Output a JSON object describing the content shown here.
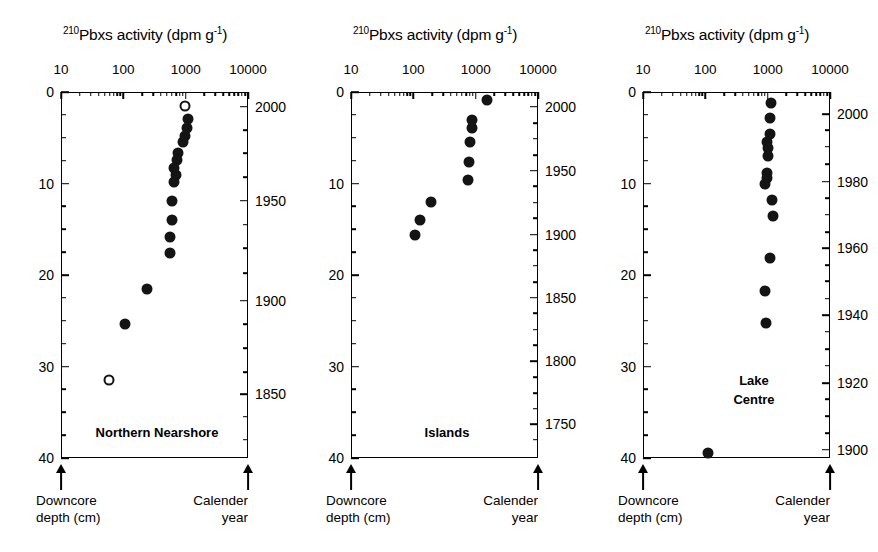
{
  "figure": {
    "background": "#ffffff",
    "marker_color": "#141414",
    "width": 878,
    "height": 552
  },
  "axis_title": {
    "superscript": "210",
    "main": "Pbxs activity (dpm g",
    "exponent": "-1",
    "close": ")",
    "full": "210Pbxs activity (dpm g-1)"
  },
  "footer": {
    "left_line1": "Downcore",
    "left_line2": "depth (cm)",
    "right_line1": "Calender",
    "right_line2": "year"
  },
  "chart_data": [
    {
      "type": "scatter",
      "title": "210Pbxs activity (dpm g-1)",
      "panel_label": "Northern Nearshore",
      "panel_label_lines": [
        "Northern Nearshore"
      ],
      "xlabel": "210Pbxs activity (dpm g-1)",
      "ylabel": "Downcore depth (cm)",
      "y2label": "Calender year",
      "xscale": "log",
      "xlim": [
        10,
        10000
      ],
      "xticks": [
        10,
        100,
        1000,
        10000
      ],
      "xtick_labels": [
        "10",
        "100",
        "1000",
        "10000"
      ],
      "ylim": [
        0,
        40
      ],
      "yticks": [
        0,
        10,
        20,
        30,
        40
      ],
      "ytick_labels": [
        "0",
        "10",
        "20",
        "30",
        "40"
      ],
      "y_minor_step": 2.5,
      "year_axis": {
        "ticks": [
          2000,
          1950,
          1900,
          1850
        ],
        "labels": [
          "2000",
          "1950",
          "1900",
          "1850"
        ],
        "depth_at_ticks": [
          1.6,
          11.9,
          22.8,
          33.0
        ],
        "minor_depths": [
          4.2,
          6.7,
          9.3,
          14.5,
          17.1,
          19.8,
          25.4,
          28.0,
          30.6,
          35.5,
          38.0
        ],
        "grid": false
      },
      "grid": false,
      "legend": "none",
      "points": [
        {
          "activity": 980,
          "depth": 1.5,
          "marker": "open"
        },
        {
          "activity": 1080,
          "depth": 3.0,
          "marker": "filled"
        },
        {
          "activity": 1040,
          "depth": 3.9,
          "marker": "filled"
        },
        {
          "activity": 960,
          "depth": 4.8,
          "marker": "filled"
        },
        {
          "activity": 900,
          "depth": 5.5,
          "marker": "filled"
        },
        {
          "activity": 760,
          "depth": 6.7,
          "marker": "filled"
        },
        {
          "activity": 720,
          "depth": 7.4,
          "marker": "filled"
        },
        {
          "activity": 660,
          "depth": 8.3,
          "marker": "filled"
        },
        {
          "activity": 690,
          "depth": 9.1,
          "marker": "filled"
        },
        {
          "activity": 660,
          "depth": 9.8,
          "marker": "filled"
        },
        {
          "activity": 600,
          "depth": 11.9,
          "marker": "filled"
        },
        {
          "activity": 600,
          "depth": 14.0,
          "marker": "filled"
        },
        {
          "activity": 560,
          "depth": 15.9,
          "marker": "filled"
        },
        {
          "activity": 560,
          "depth": 17.6,
          "marker": "filled"
        },
        {
          "activity": 240,
          "depth": 21.5,
          "marker": "filled"
        },
        {
          "activity": 105,
          "depth": 25.4,
          "marker": "filled"
        },
        {
          "activity": 58,
          "depth": 31.5,
          "marker": "open"
        }
      ]
    },
    {
      "type": "scatter",
      "title": "210Pbxs activity (dpm g-1)",
      "panel_label": "Islands",
      "panel_label_lines": [
        "Islands"
      ],
      "xlabel": "210Pbxs activity (dpm g-1)",
      "ylabel": "Downcore depth (cm)",
      "y2label": "Calender year",
      "xscale": "log",
      "xlim": [
        10,
        10000
      ],
      "xticks": [
        10,
        100,
        1000,
        10000
      ],
      "xtick_labels": [
        "10",
        "100",
        "1000",
        "10000"
      ],
      "ylim": [
        0,
        40
      ],
      "yticks": [
        0,
        10,
        20,
        30,
        40
      ],
      "ytick_labels": [
        "0",
        "10",
        "20",
        "30",
        "40"
      ],
      "y_minor_step": 2.5,
      "year_axis": {
        "ticks": [
          2000,
          1950,
          1900,
          1850,
          1800,
          1750
        ],
        "labels": [
          "2000",
          "1950",
          "1900",
          "1850",
          "1800",
          "1750"
        ],
        "depth_at_ticks": [
          1.6,
          8.6,
          15.6,
          22.5,
          29.4,
          36.3
        ],
        "minor_depths": [
          3.4,
          5.1,
          6.9,
          10.3,
          12.1,
          13.8,
          17.3,
          19.0,
          20.8,
          24.2,
          26.0,
          27.7,
          31.2,
          32.9,
          34.6,
          38.0
        ],
        "grid": false
      },
      "grid": false,
      "legend": "none",
      "points": [
        {
          "activity": 1520,
          "depth": 0.9,
          "marker": "filled"
        },
        {
          "activity": 880,
          "depth": 3.1,
          "marker": "filled"
        },
        {
          "activity": 880,
          "depth": 3.9,
          "marker": "filled"
        },
        {
          "activity": 810,
          "depth": 5.5,
          "marker": "filled"
        },
        {
          "activity": 770,
          "depth": 7.6,
          "marker": "filled"
        },
        {
          "activity": 760,
          "depth": 9.6,
          "marker": "filled"
        },
        {
          "activity": 190,
          "depth": 12.0,
          "marker": "filled"
        },
        {
          "activity": 130,
          "depth": 14.0,
          "marker": "filled"
        },
        {
          "activity": 108,
          "depth": 15.6,
          "marker": "filled"
        }
      ]
    },
    {
      "type": "scatter",
      "title": "210Pbxs activity (dpm g-1)",
      "panel_label": "Lake Centre",
      "panel_label_lines": [
        "Lake",
        "Centre"
      ],
      "xlabel": "210Pbxs activity (dpm g-1)",
      "ylabel": "Downcore depth (cm)",
      "y2label": "Calender year",
      "xscale": "log",
      "xlim": [
        10,
        10000
      ],
      "xticks": [
        10,
        100,
        1000,
        10000
      ],
      "xtick_labels": [
        "10",
        "100",
        "1000",
        "10000"
      ],
      "ylim": [
        0,
        40
      ],
      "yticks": [
        0,
        10,
        20,
        30,
        40
      ],
      "ytick_labels": [
        "0",
        "10",
        "20",
        "30",
        "40"
      ],
      "y_minor_step": 2.5,
      "year_axis": {
        "ticks": [
          2000,
          1980,
          1960,
          1940,
          1920,
          1900
        ],
        "labels": [
          "2000",
          "1980",
          "1960",
          "1940",
          "1920",
          "1900"
        ],
        "depth_at_ticks": [
          2.4,
          9.8,
          17.1,
          24.4,
          31.8,
          39.1
        ],
        "minor_depths": [
          4.2,
          6.0,
          7.9,
          11.6,
          13.4,
          15.3,
          18.9,
          20.7,
          22.6,
          26.2,
          28.1,
          29.9,
          33.6,
          35.4,
          37.3
        ],
        "grid": false
      },
      "grid": false,
      "legend": "none",
      "points": [
        {
          "activity": 1120,
          "depth": 1.2,
          "marker": "filled"
        },
        {
          "activity": 1100,
          "depth": 2.8,
          "marker": "filled"
        },
        {
          "activity": 1090,
          "depth": 4.6,
          "marker": "filled"
        },
        {
          "activity": 960,
          "depth": 5.5,
          "marker": "filled"
        },
        {
          "activity": 1000,
          "depth": 6.1,
          "marker": "filled"
        },
        {
          "activity": 1020,
          "depth": 7.0,
          "marker": "filled"
        },
        {
          "activity": 980,
          "depth": 8.8,
          "marker": "filled"
        },
        {
          "activity": 960,
          "depth": 9.4,
          "marker": "filled"
        },
        {
          "activity": 920,
          "depth": 10.1,
          "marker": "filled"
        },
        {
          "activity": 1180,
          "depth": 11.8,
          "marker": "filled"
        },
        {
          "activity": 1200,
          "depth": 13.6,
          "marker": "filled"
        },
        {
          "activity": 1090,
          "depth": 18.1,
          "marker": "filled"
        },
        {
          "activity": 920,
          "depth": 21.7,
          "marker": "filled"
        },
        {
          "activity": 930,
          "depth": 25.3,
          "marker": "filled"
        },
        {
          "activity": 112,
          "depth": 39.4,
          "marker": "filled"
        }
      ]
    }
  ]
}
